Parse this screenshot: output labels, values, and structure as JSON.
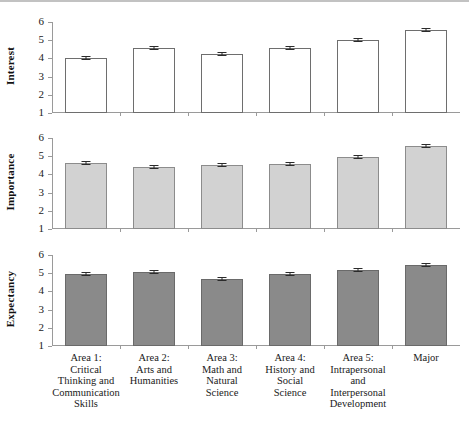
{
  "chart_data": {
    "type": "bar",
    "title": "",
    "subtitle": "",
    "xlabel": "",
    "panels": [
      {
        "ylabel": "Interest",
        "ylim": [
          1,
          6
        ],
        "yticks": [
          1,
          2,
          3,
          4,
          5,
          6
        ],
        "fill": "open",
        "values": [
          4.02,
          4.55,
          4.22,
          4.58,
          5.0,
          5.58
        ],
        "errors": [
          0.07,
          0.06,
          0.06,
          0.06,
          0.06,
          0.05
        ]
      },
      {
        "ylabel": "Importance",
        "ylim": [
          1,
          6
        ],
        "yticks": [
          1,
          2,
          3,
          4,
          5,
          6
        ],
        "fill": "light",
        "values": [
          4.6,
          4.42,
          4.52,
          4.57,
          4.95,
          5.55
        ],
        "errors": [
          0.06,
          0.06,
          0.06,
          0.06,
          0.05,
          0.05
        ]
      },
      {
        "ylabel": "Expectancy",
        "ylim": [
          1,
          6
        ],
        "yticks": [
          1,
          2,
          3,
          4,
          5,
          6
        ],
        "fill": "dark",
        "values": [
          4.98,
          5.06,
          4.68,
          4.98,
          5.2,
          5.45
        ],
        "errors": [
          0.05,
          0.05,
          0.06,
          0.05,
          0.05,
          0.05
        ]
      }
    ],
    "categories": [
      "Area 1:\nCritical\nThinking and\nCommunication\nSkills",
      "Area 2:\nArts and\nHumanities",
      "Area 3:\nMath and\nNatural\nScience",
      "Area 4:\nHistory and\nSocial\nScience",
      "Area 5:\nIntrapersonal\nand\nInterpersonal\nDevelopment",
      "Major"
    ],
    "category_lines": [
      [
        "Area 1:",
        "Critical",
        "Thinking and",
        "Communication",
        "Skills"
      ],
      [
        "Area 2:",
        "Arts and",
        "Humanities"
      ],
      [
        "Area 3:",
        "Math and",
        "Natural",
        "Science"
      ],
      [
        "Area 4:",
        "History and",
        "Social",
        "Science"
      ],
      [
        "Area 5:",
        "Intrapersonal",
        "and",
        "Interpersonal",
        "Development"
      ],
      [
        "Major"
      ]
    ],
    "grid": false,
    "legend": "none",
    "colors": {
      "open_fill": "#ffffff",
      "light_fill": "#d2d2d2",
      "dark_fill": "#8a8a8a",
      "axis": "#9a9a9a",
      "error_bar": "#2b2b2b"
    }
  }
}
